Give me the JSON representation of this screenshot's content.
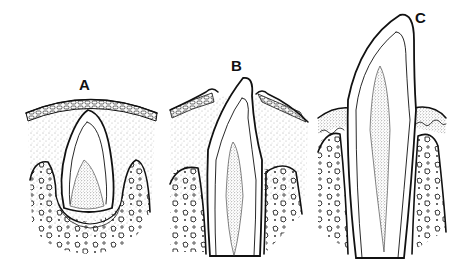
{
  "figure": {
    "panels": [
      {
        "id": "A",
        "label": "A",
        "stage": "Tooth crown within bone crypt beneath oral epithelium"
      },
      {
        "id": "B",
        "label": "B",
        "stage": "Crown penetrating oral epithelium"
      },
      {
        "id": "C",
        "label": "C",
        "stage": "Tooth erupted into occlusion with gingiva around neck"
      }
    ],
    "colors": {
      "ink": "#111111",
      "background": "#ffffff",
      "stipple": "#555555"
    }
  }
}
